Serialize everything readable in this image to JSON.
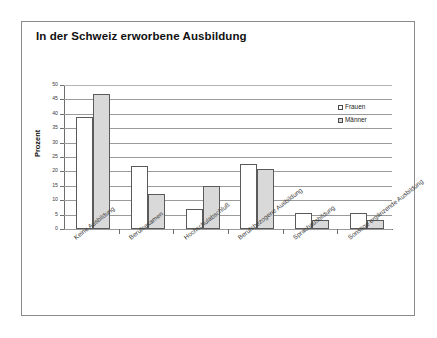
{
  "figure": {
    "title": "In der Schweiz erworbene Ausbildung"
  },
  "legend": {
    "position": "inside-top-right",
    "entries": [
      {
        "label": "Frauen",
        "swatch": "legend-swatch-white",
        "color": "#ffffff"
      },
      {
        "label": "Männer",
        "swatch": "legend-swatch-gray",
        "color": "#d9d9d9"
      }
    ]
  },
  "chart_data": {
    "type": "bar",
    "title": "In der Schweiz erworbene Ausbildung",
    "subtitle": "",
    "xlabel": "",
    "ylabel": "Prozent",
    "ylim": [
      0,
      50
    ],
    "ytick_step": 5,
    "yticks": [
      0,
      5,
      10,
      15,
      20,
      25,
      30,
      35,
      40,
      45,
      50
    ],
    "ytick_labels": [
      "0",
      "5",
      "10",
      "15",
      "20",
      "25",
      "30",
      "35",
      "40",
      "45",
      "50"
    ],
    "grid": true,
    "grid_axis": "y",
    "legend_position": "upper right",
    "categories": [
      "Keine Ausbildung",
      "Berufsexamen",
      "Hochschulabschluß",
      "Berufsbezogene Ausbildung",
      "Sprachausbildung",
      "Sonstige ergänzende Ausbildung"
    ],
    "series": [
      {
        "name": "Frauen",
        "color": "#ffffff",
        "edgecolor": "#5a5a5a",
        "values": [
          39,
          22,
          7,
          22.5,
          5.5,
          5.5
        ]
      },
      {
        "name": "Männer",
        "color": "#d9d9d9",
        "edgecolor": "#5a5a5a",
        "values": [
          47,
          12,
          15,
          21,
          3,
          3
        ]
      }
    ]
  }
}
